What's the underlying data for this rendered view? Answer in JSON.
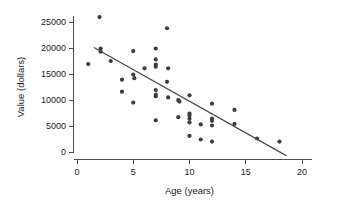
{
  "chart_data": {
    "type": "scatter",
    "title": "",
    "xlabel": "Age (years)",
    "ylabel": "Value (dollars)",
    "xlim": [
      0,
      20
    ],
    "ylim": [
      0,
      26500
    ],
    "xticks": [
      0,
      5,
      10,
      15,
      20
    ],
    "yticks": [
      0,
      5000,
      10000,
      15000,
      20000,
      25000
    ],
    "xtick_labels": [
      "0",
      "5",
      "10",
      "15",
      "20"
    ],
    "ytick_labels": [
      "0",
      "5000",
      "10000",
      "15000",
      "20000",
      "25000"
    ],
    "grid": false,
    "legend": null,
    "point_color": "#3d3d3d",
    "line_color": "#4a4a4a",
    "axis_color": "#4d4d4d",
    "points": [
      {
        "x": 1.0,
        "y": 16900
      },
      {
        "x": 2.0,
        "y": 25950
      },
      {
        "x": 2.1,
        "y": 19900
      },
      {
        "x": 2.1,
        "y": 19300
      },
      {
        "x": 3.0,
        "y": 17500
      },
      {
        "x": 4.0,
        "y": 13900
      },
      {
        "x": 4.0,
        "y": 11600
      },
      {
        "x": 5.0,
        "y": 19400
      },
      {
        "x": 5.0,
        "y": 14900
      },
      {
        "x": 5.1,
        "y": 14200
      },
      {
        "x": 5.0,
        "y": 9500
      },
      {
        "x": 6.0,
        "y": 16100
      },
      {
        "x": 7.0,
        "y": 19900
      },
      {
        "x": 7.0,
        "y": 17800
      },
      {
        "x": 7.0,
        "y": 16800
      },
      {
        "x": 7.0,
        "y": 16400
      },
      {
        "x": 7.0,
        "y": 11900
      },
      {
        "x": 7.0,
        "y": 11000
      },
      {
        "x": 7.0,
        "y": 10700
      },
      {
        "x": 7.0,
        "y": 6100
      },
      {
        "x": 8.0,
        "y": 23800
      },
      {
        "x": 8.1,
        "y": 16100
      },
      {
        "x": 8.0,
        "y": 13500
      },
      {
        "x": 8.1,
        "y": 10500
      },
      {
        "x": 9.0,
        "y": 10000
      },
      {
        "x": 9.1,
        "y": 9700
      },
      {
        "x": 9.0,
        "y": 6700
      },
      {
        "x": 10.0,
        "y": 10900
      },
      {
        "x": 10.0,
        "y": 7400
      },
      {
        "x": 10.0,
        "y": 7000
      },
      {
        "x": 10.0,
        "y": 6400
      },
      {
        "x": 10.0,
        "y": 5700
      },
      {
        "x": 10.0,
        "y": 3100
      },
      {
        "x": 11.0,
        "y": 5300
      },
      {
        "x": 11.0,
        "y": 2400
      },
      {
        "x": 12.0,
        "y": 9300
      },
      {
        "x": 12.0,
        "y": 6400
      },
      {
        "x": 12.0,
        "y": 6000
      },
      {
        "x": 12.0,
        "y": 5100
      },
      {
        "x": 12.0,
        "y": 2000
      },
      {
        "x": 14.0,
        "y": 8100
      },
      {
        "x": 14.0,
        "y": 5400
      },
      {
        "x": 16.0,
        "y": 2600
      },
      {
        "x": 18.0,
        "y": 2000
      }
    ],
    "trend_line": {
      "x_start": 1.5,
      "y_start": 20100,
      "x_end": 18.6,
      "y_end": -700
    }
  }
}
